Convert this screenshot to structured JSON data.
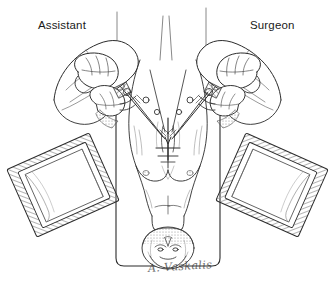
{
  "figure": {
    "labels": {
      "assistant": "Assistant",
      "surgeon": "Surgeon"
    },
    "signature": "A. Vaskalis",
    "colors": {
      "ink": "#1a1a1a",
      "line": "#2b2b2b",
      "hatch": "#8d8d8d",
      "shade": "#bdbdbd",
      "paper": "#ffffff",
      "light_shade": "#e2e2e2"
    },
    "elements": [
      {
        "name": "operating-table",
        "description": "vertical rounded rectangle, patient supine"
      },
      {
        "name": "patient-body",
        "description": "torso viewed inverted, head toward bottom of frame"
      },
      {
        "name": "patient-head",
        "description": "head with face, at lower end of table"
      },
      {
        "name": "surgical-site",
        "description": "midline chest incision with retractors and clamps"
      },
      {
        "name": "assistant-hands",
        "description": "gloved hands and gowned forearms, left side"
      },
      {
        "name": "surgeon-hands",
        "description": "gloved hands and gowned forearms, right side"
      },
      {
        "name": "instrument-tray-left",
        "description": "tilted draped Mayo stand, lower left"
      },
      {
        "name": "instrument-tray-right",
        "description": "tilted draped Mayo stand, lower right"
      },
      {
        "name": "drape-poles",
        "description": "vertical drape support rods above table"
      }
    ]
  }
}
